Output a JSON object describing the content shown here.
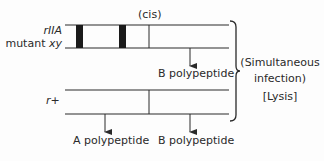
{
  "diagram": {
    "type": "genetic-complementation-cis",
    "top_chromosome": {
      "label_line1": "rIIA",
      "label_line2": "mutant xy",
      "position_label": "(cis)",
      "product": "B polypeptide"
    },
    "bottom_chromosome": {
      "label": "r+",
      "products": [
        "A polypeptide",
        "B polypeptide"
      ]
    },
    "bracket_labels": {
      "line1": "(Simultaneous",
      "line2": "infection)",
      "outcome": "[Lysis]"
    },
    "colors": {
      "line": "#2a2a2a",
      "mutation_block": "#1a1a1a",
      "background": "#fdfdfd"
    }
  }
}
